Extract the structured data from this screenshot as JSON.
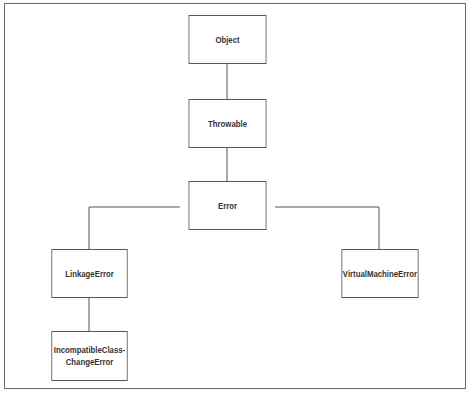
{
  "diagram": {
    "type": "class-hierarchy",
    "nodes": {
      "object": "Object",
      "throwable": "Throwable",
      "error": "Error",
      "linkage_error": "LinkageError",
      "virtual_machine_error": "VirtualMachineError",
      "incompatible_line1": "IncompatibleClass-",
      "incompatible_line2": "ChangeError"
    },
    "edges": [
      [
        "Object",
        "Throwable"
      ],
      [
        "Throwable",
        "Error"
      ],
      [
        "Error",
        "LinkageError"
      ],
      [
        "Error",
        "VirtualMachineError"
      ],
      [
        "LinkageError",
        "IncompatibleClassChangeError"
      ]
    ]
  }
}
